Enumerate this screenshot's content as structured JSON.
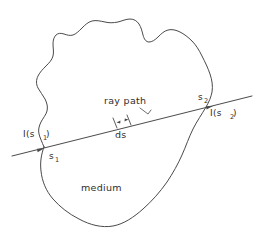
{
  "figure": {
    "background_color": "#ffffff",
    "stroke_color": "#4a4a4a",
    "text_color": "#2e2e2e"
  },
  "labels": {
    "ray_path": "ray path",
    "medium": "medium",
    "ds": "ds",
    "intensity_in_base": "I(s",
    "intensity_in_sub": "1",
    "intensity_in_close": ")",
    "intensity_out_base": "I(s",
    "intensity_out_sub": "2",
    "intensity_out_close": ")",
    "point_in_base": "s",
    "point_in_sub": "1",
    "point_out_base": "s",
    "point_out_sub": "2"
  },
  "annotations": {
    "entry_point": "s1",
    "exit_point": "s2",
    "entry_intensity": "I(s1)",
    "exit_intensity": "I(s2)",
    "path_element": "ds",
    "region": "medium",
    "ray_label": "ray path"
  }
}
